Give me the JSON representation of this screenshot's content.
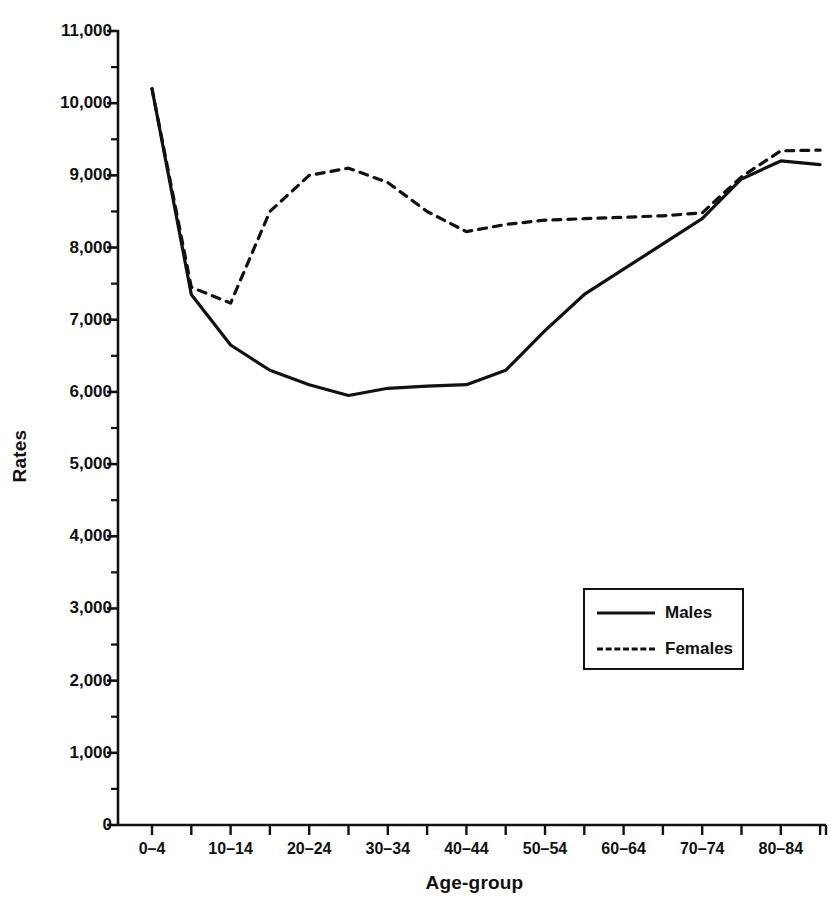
{
  "chart_data": {
    "type": "line",
    "title": "",
    "xlabel": "Age-group",
    "ylabel": "Rates",
    "ylim": [
      0,
      11000
    ],
    "ytick_step": 1000,
    "yminor_step": 500,
    "grid": false,
    "legend_position": "inside-lower-right",
    "categories": [
      "0–4",
      "5–9",
      "10–14",
      "15–19",
      "20–24",
      "25–29",
      "30–34",
      "35–39",
      "40–44",
      "45–49",
      "50–54",
      "55–59",
      "60–64",
      "65–69",
      "70–74",
      "75–79",
      "80–84",
      "85+"
    ],
    "xtick_labels_shown": [
      "0–4",
      "10–14",
      "20–24",
      "30–34",
      "40–44",
      "50–54",
      "60–64",
      "70–74",
      "80–84"
    ],
    "ytick_labels": [
      "0",
      "1,000",
      "2,000",
      "3,000",
      "4,000",
      "5,000",
      "6,000",
      "7,000",
      "8,000",
      "9,000",
      "10,000",
      "11,000"
    ],
    "ytick_values": [
      0,
      1000,
      2000,
      3000,
      4000,
      5000,
      6000,
      7000,
      8000,
      9000,
      10000,
      11000
    ],
    "series": [
      {
        "name": "Males",
        "style": "solid",
        "color": "#111111",
        "values": [
          10200,
          7350,
          6650,
          6300,
          6100,
          5950,
          6050,
          6080,
          6100,
          6300,
          6850,
          7350,
          7700,
          8050,
          8400,
          8950,
          9200,
          9150
        ]
      },
      {
        "name": "Females",
        "style": "dashed",
        "color": "#111111",
        "values": [
          10200,
          7450,
          7230,
          8500,
          9000,
          9100,
          8900,
          8500,
          8220,
          8320,
          8380,
          8400,
          8420,
          8440,
          8480,
          8980,
          9340,
          9350
        ]
      }
    ]
  },
  "legend": {
    "entries": [
      {
        "label": "Males",
        "style": "solid"
      },
      {
        "label": "Females",
        "style": "dashed"
      }
    ]
  }
}
